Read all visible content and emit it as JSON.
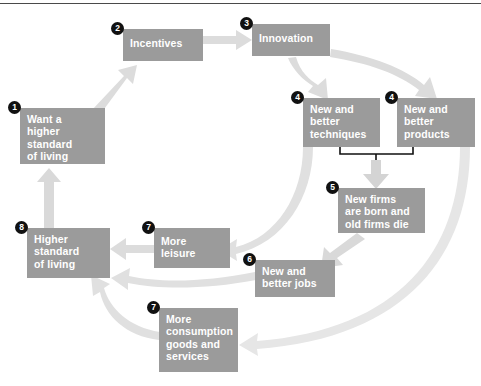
{
  "diagram": {
    "colors": {
      "box_fill": "#9b9b9b",
      "box_text": "#ffffff",
      "badge_fill": "#111111",
      "badge_text": "#ffffff",
      "arrow_fill": "#d7d7d7",
      "arrow_fill_light": "#e4e4e4",
      "bracket_stroke": "#111111",
      "rule": "#4a4a4a",
      "background": "#ffffff"
    },
    "nodes": [
      {
        "id": "want-higher-standard",
        "badge": "1",
        "label": "Want a\nhigher\nstandard\nof living",
        "x": 20,
        "y": 108,
        "w": 85,
        "h": 56
      },
      {
        "id": "incentives",
        "badge": "2",
        "label": "Incentives",
        "x": 123,
        "y": 29,
        "w": 80,
        "h": 32
      },
      {
        "id": "innovation",
        "badge": "3",
        "label": "Innovation",
        "x": 252,
        "y": 24,
        "w": 78,
        "h": 32
      },
      {
        "id": "new-better-techniques",
        "badge": "4",
        "label": "New and\nbetter\ntechniques",
        "x": 303,
        "y": 98,
        "w": 77,
        "h": 49
      },
      {
        "id": "new-better-products",
        "badge": "4",
        "label": "New and\nbetter\nproducts",
        "x": 397,
        "y": 98,
        "w": 78,
        "h": 49
      },
      {
        "id": "new-firms-born-old-die",
        "badge": "5",
        "label": "New firms\nare born and\nold firms die",
        "x": 338,
        "y": 188,
        "w": 87,
        "h": 45
      },
      {
        "id": "new-better-jobs",
        "badge": "6",
        "label": "New and\nbetter jobs",
        "x": 255,
        "y": 260,
        "w": 80,
        "h": 37
      },
      {
        "id": "more-leisure",
        "badge": "7",
        "label": "More\nleisure",
        "x": 154,
        "y": 228,
        "w": 76,
        "h": 40
      },
      {
        "id": "more-consumption-goods-services",
        "badge": "7",
        "label": "More\nconsumption\ngoods and\nservices",
        "x": 159,
        "y": 308,
        "w": 79,
        "h": 64
      },
      {
        "id": "higher-standard-of-living",
        "badge": "8",
        "label": "Higher\nstandard\nof living",
        "x": 27,
        "y": 228,
        "w": 83,
        "h": 50
      }
    ],
    "connectors": [
      {
        "id": "want-to-incentives",
        "from": "want-higher-standard",
        "to": "incentives"
      },
      {
        "id": "incentives-to-innovation",
        "from": "incentives",
        "to": "innovation"
      },
      {
        "id": "innovation-to-techniques",
        "from": "innovation",
        "to": "new-better-techniques"
      },
      {
        "id": "innovation-to-products",
        "from": "innovation",
        "to": "new-better-products"
      },
      {
        "id": "techniques-products-bracket-to-new-firms",
        "from": "new-better-techniques",
        "to": "new-firms-born-old-die"
      },
      {
        "id": "new-firms-to-jobs",
        "from": "new-firms-born-old-die",
        "to": "new-better-jobs"
      },
      {
        "id": "techniques-to-more-leisure",
        "from": "new-better-techniques",
        "to": "more-leisure"
      },
      {
        "id": "products-to-more-consumption",
        "from": "new-better-products",
        "to": "more-consumption-goods-services"
      },
      {
        "id": "more-leisure-to-higher-standard",
        "from": "more-leisure",
        "to": "higher-standard-of-living"
      },
      {
        "id": "jobs-to-higher-standard",
        "from": "new-better-jobs",
        "to": "higher-standard-of-living"
      },
      {
        "id": "consumption-to-higher-standard",
        "from": "more-consumption-goods-services",
        "to": "higher-standard-of-living"
      },
      {
        "id": "higher-standard-to-want",
        "from": "higher-standard-of-living",
        "to": "want-higher-standard"
      }
    ]
  }
}
